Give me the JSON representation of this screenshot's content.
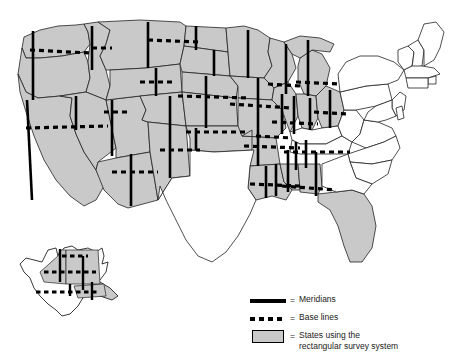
{
  "figure": {
    "name": "us-public-land-survey-map"
  },
  "colors": {
    "shaded_state_fill": "#c9c9c9",
    "unshaded_state_fill": "#ffffff",
    "state_border": "#222222",
    "meridian": "#000000",
    "base_line": "#000000",
    "water": "#ffffff",
    "text": "#1a1a1a"
  },
  "legend": {
    "name": "map-legend",
    "items": [
      {
        "symbol": "solid-line",
        "equals": "=",
        "label": "Meridians",
        "label2": ""
      },
      {
        "symbol": "dashed-line",
        "equals": "=",
        "label": "Base lines",
        "label2": ""
      },
      {
        "symbol": "gray-swatch",
        "equals": "=",
        "label": "States using the",
        "label2": "rectangular survey system"
      }
    ]
  },
  "map": {
    "shaded_states": [
      "Washington",
      "Oregon",
      "California",
      "Idaho",
      "Nevada",
      "Utah",
      "Arizona",
      "Montana",
      "Wyoming",
      "Colorado",
      "New Mexico",
      "North Dakota",
      "South Dakota",
      "Nebraska",
      "Kansas",
      "Oklahoma",
      "Minnesota",
      "Iowa",
      "Missouri",
      "Arkansas",
      "Louisiana",
      "Wisconsin",
      "Illinois",
      "Michigan",
      "Indiana",
      "Ohio",
      "Mississippi",
      "Alabama",
      "Florida",
      "Alaska"
    ],
    "unshaded_states": [
      "Texas",
      "Maine",
      "New Hampshire",
      "Vermont",
      "Massachusetts",
      "Rhode Island",
      "Connecticut",
      "New York",
      "Pennsylvania",
      "New Jersey",
      "Delaware",
      "Maryland",
      "West Virginia",
      "Virginia",
      "Kentucky",
      "Tennessee",
      "North Carolina",
      "South Carolina",
      "Georgia"
    ],
    "insets": [
      "Alaska"
    ]
  }
}
